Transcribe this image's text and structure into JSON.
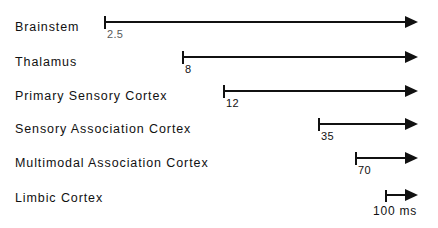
{
  "chart_data": {
    "type": "bar",
    "title": "",
    "subtitle": "",
    "xlabel": "",
    "ylabel": "",
    "orientation": "horizontal",
    "grid": false,
    "legend": null,
    "units": "ms",
    "axis_max_ms": 300,
    "categories": [
      "Brainstem",
      "Thalamus",
      "Primary Sensory Cortex",
      "Sensory Association Cortex",
      "Multimodal Association Cortex",
      "Limbic Cortex"
    ],
    "values": [
      2.5,
      8,
      12,
      35,
      70,
      null
    ],
    "value_labels": [
      "2.5",
      "8",
      "12",
      "35",
      "70",
      ""
    ],
    "scale_bar": {
      "label": "100 ms",
      "value": 100,
      "unit": "ms"
    }
  },
  "rows": [
    {
      "label": "Brainstem",
      "value_label": "2.5",
      "has_arrow": true,
      "faded": true,
      "label_top": 20,
      "tick_x": 104,
      "arrow_end_x": 418,
      "group_top": 16
    },
    {
      "label": "Thalamus",
      "value_label": "8",
      "has_arrow": true,
      "faded": false,
      "label_top": 55,
      "tick_x": 182,
      "arrow_end_x": 418,
      "group_top": 51
    },
    {
      "label": "Primary Sensory Cortex",
      "value_label": "12",
      "has_arrow": true,
      "faded": false,
      "label_top": 89,
      "tick_x": 223,
      "arrow_end_x": 418,
      "group_top": 85
    },
    {
      "label": "Sensory Association Cortex",
      "value_label": "35",
      "has_arrow": true,
      "faded": false,
      "label_top": 122,
      "tick_x": 318,
      "arrow_end_x": 418,
      "group_top": 118
    },
    {
      "label": "Multimodal Association Cortex",
      "value_label": "70",
      "has_arrow": true,
      "faded": false,
      "label_top": 156,
      "tick_x": 355,
      "arrow_end_x": 418,
      "group_top": 152
    },
    {
      "label": "Limbic Cortex",
      "value_label": "",
      "has_arrow": false,
      "faded": false,
      "label_top": 191,
      "tick_x": null,
      "arrow_end_x": null,
      "group_top": null
    }
  ],
  "scale": {
    "label": "100 ms",
    "tick_x": 385,
    "arrow_end_x": 418,
    "top": 190
  },
  "colors": {
    "ink": "#111111",
    "background": "#ffffff"
  }
}
